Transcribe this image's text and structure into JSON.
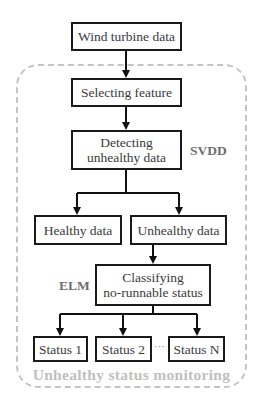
{
  "diagram": {
    "type": "flowchart",
    "nodes": {
      "input": "Wind turbine data",
      "select": "Selecting feature",
      "detect_line1": "Detecting",
      "detect_line2": "unhealthy data",
      "healthy": "Healthy data",
      "unhealthy": "Unhealthy data",
      "classify_line1": "Classifying",
      "classify_line2": "no-runnable status",
      "status1": "Status 1",
      "status2": "Status 2",
      "statusN": "Status N"
    },
    "ellipsis": "···",
    "methods": {
      "detect": "SVDD",
      "classify": "ELM"
    },
    "group_caption": "Unhealthy status monitoring",
    "edges": [
      [
        "Wind turbine data",
        "Selecting feature"
      ],
      [
        "Selecting feature",
        "Detecting unhealthy data"
      ],
      [
        "Detecting unhealthy data",
        "Healthy data"
      ],
      [
        "Detecting unhealthy data",
        "Unhealthy data"
      ],
      [
        "Unhealthy data",
        "Classifying no-runnable status"
      ],
      [
        "Classifying no-runnable status",
        "Status 1"
      ],
      [
        "Classifying no-runnable status",
        "Status 2"
      ],
      [
        "Classifying no-runnable status",
        "Status N"
      ]
    ],
    "colors": {
      "box_border": "#1a1a1a",
      "dashed_group": "#c4c4c4",
      "method_label": "#6e6e6e",
      "caption": "#c0c0c0"
    }
  }
}
